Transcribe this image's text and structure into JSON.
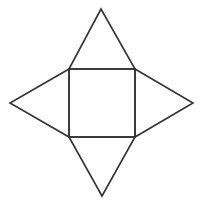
{
  "diagram": {
    "type": "pyramid-net",
    "stroke_color": "#333333",
    "background": "#ffffff",
    "stroke_width": 1.6,
    "square": {
      "x1": 69,
      "y1": 69,
      "x2": 135,
      "y2": 137
    },
    "triangles": [
      {
        "name": "top",
        "points": [
          [
            69,
            69
          ],
          [
            101,
            9
          ],
          [
            135,
            69
          ]
        ]
      },
      {
        "name": "right",
        "points": [
          [
            135,
            69
          ],
          [
            193,
            103
          ],
          [
            135,
            137
          ]
        ]
      },
      {
        "name": "bottom",
        "points": [
          [
            69,
            137
          ],
          [
            102,
            196
          ],
          [
            135,
            137
          ]
        ]
      },
      {
        "name": "left",
        "points": [
          [
            69,
            69
          ],
          [
            10,
            103
          ],
          [
            69,
            137
          ]
        ]
      }
    ]
  }
}
